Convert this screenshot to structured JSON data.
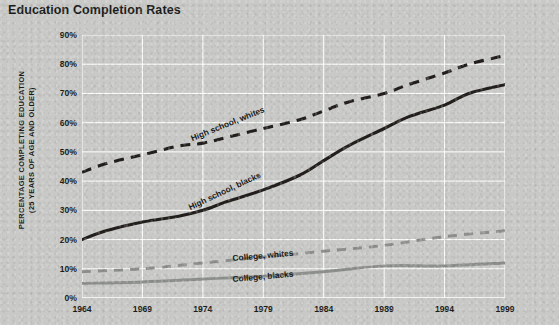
{
  "title": "Education Completion Rates",
  "axis": {
    "ylabel_line1": "PERCENTAGE COMPLETING EDUCATION",
    "ylabel_line2": "(25 YEARS OF AGE AND OLDER)"
  },
  "colors": {
    "background": "#c9cac7",
    "gridline": "#ffffff",
    "dark_series": "#231f1c",
    "light_series": "#8d8f8c",
    "text": "#1b1b1b"
  },
  "series_labels": {
    "hs_whites": "High school, whites",
    "hs_blacks": "High school, blacks",
    "college_whites": "College, whites",
    "college_blacks": "College, blacks"
  },
  "chart_data": {
    "type": "line",
    "title": "Education Completion Rates",
    "xlabel": "",
    "ylabel": "PERCENTAGE COMPLETING EDUCATION (25 YEARS OF AGE AND OLDER)",
    "xlim": [
      1964,
      1999
    ],
    "ylim": [
      0,
      90
    ],
    "ytick_labels": [
      "0%",
      "10%",
      "20%",
      "30%",
      "40%",
      "50%",
      "60%",
      "70%",
      "80%",
      "90%"
    ],
    "yticks": [
      0,
      10,
      20,
      30,
      40,
      50,
      60,
      70,
      80,
      90
    ],
    "xtick_labels": [
      "1964",
      "1969",
      "1974",
      "1979",
      "1984",
      "1989",
      "1994",
      "1999"
    ],
    "xticks": [
      1964,
      1969,
      1974,
      1979,
      1984,
      1989,
      1994,
      1999
    ],
    "grid": "horizontal-and-vertical",
    "legend": "inline-labels-on-curves",
    "series": [
      {
        "name": "High school, whites",
        "style": "dashed",
        "color": "#231f1c",
        "x": [
          1964,
          1966,
          1969,
          1972,
          1974,
          1976,
          1979,
          1982,
          1984,
          1986,
          1989,
          1991,
          1994,
          1996,
          1999
        ],
        "values": [
          43,
          46,
          49,
          52,
          53,
          55,
          58,
          61,
          64,
          67,
          70,
          73,
          77,
          80,
          83
        ]
      },
      {
        "name": "High school, blacks",
        "style": "solid",
        "color": "#231f1c",
        "x": [
          1964,
          1966,
          1969,
          1972,
          1974,
          1976,
          1979,
          1982,
          1984,
          1986,
          1989,
          1991,
          1994,
          1996,
          1999
        ],
        "values": [
          20,
          23,
          26,
          28,
          30,
          33,
          37,
          42,
          47,
          52,
          58,
          62,
          66,
          70,
          73
        ]
      },
      {
        "name": "College, whites",
        "style": "dashed",
        "color": "#8d8f8c",
        "x": [
          1964,
          1969,
          1974,
          1979,
          1984,
          1989,
          1994,
          1999
        ],
        "values": [
          9,
          10,
          12,
          14,
          16,
          18,
          21,
          23
        ]
      },
      {
        "name": "College, blacks",
        "style": "solid",
        "color": "#8d8f8c",
        "x": [
          1964,
          1969,
          1974,
          1979,
          1984,
          1989,
          1994,
          1999
        ],
        "values": [
          5,
          5.5,
          6.5,
          7.5,
          9,
          11,
          11,
          12
        ]
      }
    ]
  }
}
